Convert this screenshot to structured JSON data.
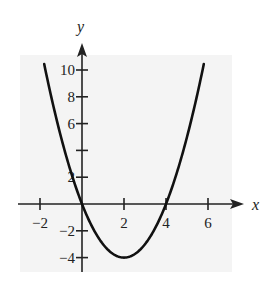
{
  "chart_data": {
    "type": "line",
    "title": "",
    "function": "y = x^2 - 4x",
    "xlabel": "x",
    "ylabel": "y",
    "xlim": [
      -2.7,
      7.5
    ],
    "ylim": [
      -5,
      12
    ],
    "x_ticks": [
      -2,
      2,
      4,
      6
    ],
    "x_tick_labels": [
      "−2",
      "2",
      "4",
      "6"
    ],
    "y_ticks": [
      10,
      8,
      6,
      4,
      2,
      -2,
      -4
    ],
    "y_tick_labels": [
      "10",
      "8",
      "6",
      "",
      "2",
      "−2",
      "−4"
    ],
    "grid": false,
    "legend": null,
    "series": [
      {
        "name": "parabola",
        "x": [
          -1.8,
          -1.5,
          -1,
          -0.5,
          0,
          0.5,
          1,
          1.5,
          2,
          2.5,
          3,
          3.5,
          4,
          4.5,
          5,
          5.5,
          5.8
        ],
        "y": [
          10.44,
          8.25,
          5,
          2.25,
          0,
          -1.75,
          -3,
          -3.75,
          -4,
          -3.75,
          -3,
          -1.75,
          0,
          2.25,
          5,
          8.25,
          10.44
        ]
      }
    ],
    "key_points": {
      "vertex": [
        2,
        -4
      ],
      "zeros": [
        0,
        4
      ]
    },
    "colors": {
      "curve": "#111111",
      "axes": "#222222",
      "background": "#f4f4f4"
    }
  }
}
